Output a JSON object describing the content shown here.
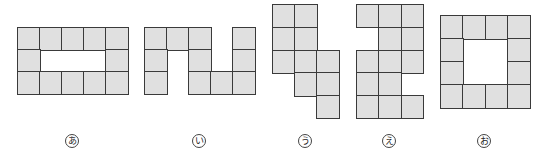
{
  "colors": {
    "cell_fill": "#e0e0e0",
    "cell_border": "#3a3a3a",
    "background": "#ffffff"
  },
  "figures": [
    {
      "id": "a",
      "label": "あ",
      "x": 17,
      "y": 27,
      "cw": 22,
      "ch": 22,
      "label_x": 72,
      "label_y": 141,
      "rows": [
        [
          1,
          1,
          1,
          1,
          1
        ],
        [
          1,
          0,
          0,
          0,
          1
        ],
        [
          1,
          1,
          1,
          1,
          1
        ]
      ]
    },
    {
      "id": "i",
      "label": "い",
      "x": 144,
      "y": 27,
      "cw": 22,
      "ch": 22,
      "label_x": 199,
      "label_y": 141,
      "rows": [
        [
          1,
          1,
          1,
          0,
          1
        ],
        [
          1,
          0,
          1,
          0,
          1
        ],
        [
          1,
          0,
          1,
          1,
          1
        ]
      ]
    },
    {
      "id": "u",
      "label": "う",
      "x": 272,
      "y": 4,
      "cw": 22,
      "ch": 22.8,
      "label_x": 305,
      "label_y": 141,
      "rows": [
        [
          1,
          1,
          0
        ],
        [
          1,
          1,
          0
        ],
        [
          1,
          1,
          1
        ],
        [
          0,
          1,
          1
        ],
        [
          0,
          0,
          1
        ]
      ]
    },
    {
      "id": "e",
      "label": "え",
      "x": 356,
      "y": 4,
      "cw": 22.3,
      "ch": 22.8,
      "label_x": 389,
      "label_y": 141,
      "rows": [
        [
          1,
          1,
          1
        ],
        [
          0,
          1,
          1
        ],
        [
          1,
          1,
          1
        ],
        [
          1,
          1,
          0
        ],
        [
          1,
          1,
          1
        ]
      ]
    },
    {
      "id": "o",
      "label": "お",
      "x": 440,
      "y": 15,
      "cw": 22.3,
      "ch": 23,
      "label_x": 484,
      "label_y": 141,
      "rows": [
        [
          1,
          1,
          1,
          1
        ],
        [
          1,
          0,
          0,
          1
        ],
        [
          1,
          0,
          0,
          1
        ],
        [
          1,
          1,
          1,
          1
        ]
      ]
    }
  ]
}
